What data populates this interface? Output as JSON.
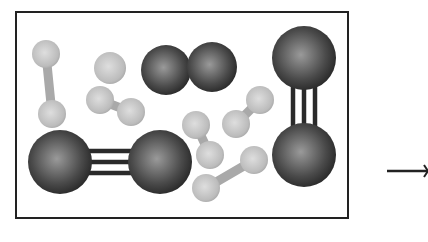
{
  "diagram": {
    "colors": {
      "background": "#ffffff",
      "border": "#222222",
      "large_atom_center": "#9a9a9a",
      "large_atom_edge": "#2a2a2a",
      "small_atom_center": "#d6d6d6",
      "small_atom_edge": "#a8a8a8",
      "bond_line": "#2a2a2a",
      "small_bond": "#a9a9a9",
      "arrow": "#222222"
    },
    "box": {
      "x": 16,
      "y": 12,
      "width": 332,
      "height": 206
    },
    "large_molecules": [
      {
        "label": "N2 space-filling",
        "atoms": [
          {
            "cx": 166,
            "cy": 70,
            "r": 25
          },
          {
            "cx": 212,
            "cy": 67,
            "r": 25
          }
        ],
        "bond": "none"
      },
      {
        "label": "N2 triple bond vertical",
        "atoms": [
          {
            "cx": 304,
            "cy": 58,
            "r": 32
          },
          {
            "cx": 304,
            "cy": 155,
            "r": 32
          }
        ],
        "bond": "triple"
      },
      {
        "label": "N2 triple bond horizontal",
        "atoms": [
          {
            "cx": 60,
            "cy": 162,
            "r": 32
          },
          {
            "cx": 160,
            "cy": 162,
            "r": 32
          }
        ],
        "bond": "triple"
      }
    ],
    "small_molecules": [
      {
        "label": "H2",
        "atoms": [
          {
            "cx": 46,
            "cy": 54,
            "r": 14
          },
          {
            "cx": 52,
            "cy": 114,
            "r": 14
          }
        ]
      },
      {
        "label": "H single",
        "atoms": [
          {
            "cx": 110,
            "cy": 68,
            "r": 16
          }
        ]
      },
      {
        "label": "H2",
        "atoms": [
          {
            "cx": 100,
            "cy": 100,
            "r": 14
          },
          {
            "cx": 131,
            "cy": 112,
            "r": 14
          }
        ]
      },
      {
        "label": "H2",
        "atoms": [
          {
            "cx": 196,
            "cy": 125,
            "r": 14
          },
          {
            "cx": 210,
            "cy": 155,
            "r": 14
          }
        ]
      },
      {
        "label": "H2",
        "atoms": [
          {
            "cx": 236,
            "cy": 124,
            "r": 14
          },
          {
            "cx": 260,
            "cy": 100,
            "r": 14
          }
        ]
      },
      {
        "label": "H2",
        "atoms": [
          {
            "cx": 206,
            "cy": 188,
            "r": 14
          },
          {
            "cx": 254,
            "cy": 160,
            "r": 14
          }
        ]
      }
    ],
    "arrow": {
      "x1": 387,
      "y1": 171,
      "x2": 428,
      "y2": 171
    }
  }
}
